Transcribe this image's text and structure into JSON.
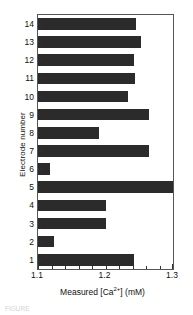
{
  "chart_data": {
    "type": "bar",
    "orientation": "horizontal",
    "title": "",
    "xlabel": "Measured [Ca2+] (mM)",
    "xlabel_parts": {
      "pre": "Measured [Ca",
      "sup": "2+",
      "post": "] (mM)"
    },
    "ylabel": "Electrode number",
    "categories": [
      "1",
      "2",
      "3",
      "4",
      "5",
      "6",
      "7",
      "8",
      "9",
      "10",
      "11",
      "12",
      "13",
      "14"
    ],
    "values": [
      1.242,
      1.124,
      1.2,
      1.2,
      1.3,
      1.118,
      1.264,
      1.19,
      1.264,
      1.233,
      1.244,
      1.242,
      1.252,
      1.245
    ],
    "xlim": [
      1.1,
      1.3
    ],
    "xticks": [
      1.1,
      1.2,
      1.3
    ],
    "xticklabels": [
      "1.1",
      "1.2",
      "1.3"
    ],
    "xminorticks": [
      1.12,
      1.14,
      1.16,
      1.18,
      1.22,
      1.24,
      1.26,
      1.28
    ],
    "grid": false,
    "legend": null,
    "bar_color": "#2b2b2b",
    "frame_color": "#555555",
    "background": "#ffffff"
  },
  "caption": {
    "text": "FIGURE"
  }
}
